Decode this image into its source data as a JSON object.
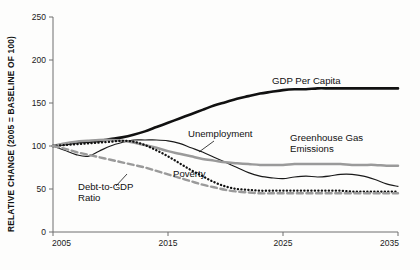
{
  "chart_data": {
    "type": "line",
    "title": "",
    "xlabel": "",
    "ylabel": "RELATIVE CHANGE (2005 = BASELINE OF 100)",
    "xlim": [
      2005,
      2035
    ],
    "ylim": [
      0,
      250
    ],
    "xticks": [
      "2005",
      "2015",
      "2025",
      "2035"
    ],
    "yticks": [
      "0",
      "50",
      "100",
      "150",
      "200",
      "250"
    ],
    "grid": false,
    "legend_position": "inline-annotations",
    "x": [
      2005,
      2006,
      2007,
      2008,
      2009,
      2010,
      2011,
      2012,
      2013,
      2014,
      2015,
      2016,
      2017,
      2018,
      2019,
      2020,
      2021,
      2022,
      2023,
      2024,
      2025,
      2026,
      2027,
      2028,
      2029,
      2030,
      2031,
      2032,
      2033,
      2034,
      2035
    ],
    "series": [
      {
        "name": "GDP Per Capita",
        "style": "solid-black-thick",
        "color": "#111111",
        "values": [
          100,
          102,
          104,
          105,
          106,
          108,
          110,
          113,
          117,
          122,
          127,
          132,
          137,
          142,
          147,
          151,
          155,
          158,
          161,
          163,
          165,
          166,
          166,
          167,
          167,
          167,
          167,
          167,
          167,
          167,
          167
        ]
      },
      {
        "name": "Unemployment",
        "style": "solid-black-thin",
        "color": "#1a1a1a",
        "values": [
          100,
          95,
          90,
          88,
          94,
          100,
          104,
          107,
          107,
          107,
          106,
          103,
          98,
          93,
          87,
          81,
          75,
          69,
          65,
          63,
          62,
          64,
          65,
          64,
          65,
          67,
          67,
          65,
          61,
          56,
          53
        ]
      },
      {
        "name": "Greenhouse Gas Emissions",
        "style": "solid-gray-thick",
        "color": "#9a9a9a",
        "values": [
          100,
          103,
          105,
          106,
          107,
          107,
          106,
          104,
          101,
          98,
          94,
          91,
          88,
          85,
          83,
          81,
          80,
          79,
          78,
          78,
          78,
          79,
          79,
          79,
          79,
          79,
          78,
          78,
          78,
          77,
          77
        ]
      },
      {
        "name": "Poverty",
        "style": "dotted-black",
        "color": "#111111",
        "values": [
          100,
          101,
          102,
          103,
          104,
          105,
          106,
          105,
          101,
          95,
          88,
          80,
          72,
          65,
          58,
          53,
          50,
          49,
          48,
          48,
          48,
          48,
          48,
          48,
          48,
          48,
          47,
          47,
          47,
          47,
          47
        ]
      },
      {
        "name": "Debt-to-GDP Ratio",
        "style": "dashed-gray",
        "color": "#9a9a9a",
        "values": [
          100,
          97,
          93,
          90,
          87,
          84,
          81,
          78,
          75,
          71,
          67,
          63,
          59,
          55,
          52,
          49,
          47,
          46,
          45,
          45,
          45,
          45,
          45,
          45,
          45,
          45,
          45,
          45,
          45,
          45,
          45
        ]
      }
    ],
    "annotations": [
      {
        "name": "GDP Per Capita",
        "x": 272,
        "y": 84,
        "anchor": "start",
        "leader": false
      },
      {
        "name": "Unemployment",
        "x": 188,
        "y": 137,
        "anchor": "start",
        "leader": true,
        "leader_path": "M 214 141 L 199 152"
      },
      {
        "name": "Greenhouse Gas",
        "x": 290,
        "y": 141,
        "anchor": "start",
        "leader": false
      },
      {
        "name": "Emissions",
        "x": 290,
        "y": 152,
        "anchor": "start",
        "leader": false
      },
      {
        "name": "Poverty",
        "x": 173,
        "y": 177,
        "anchor": "start",
        "leader": false
      },
      {
        "name": "Debt-to-GDP",
        "x": 78,
        "y": 190,
        "anchor": "start",
        "leader": true,
        "leader_path": "M 116 186 L 127 174"
      },
      {
        "name": "Ratio",
        "x": 78,
        "y": 201,
        "anchor": "start",
        "leader": false
      }
    ]
  }
}
